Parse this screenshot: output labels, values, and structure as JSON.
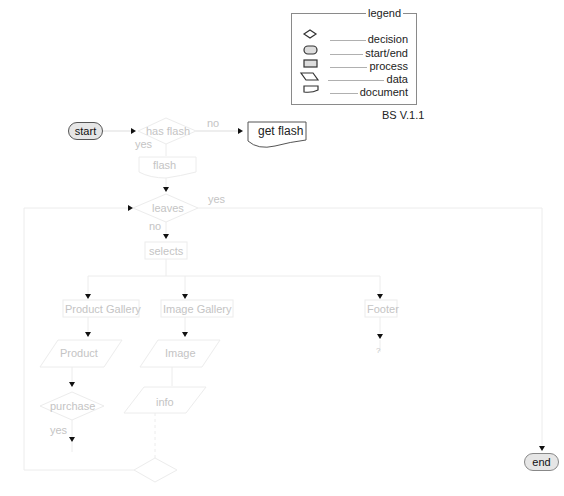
{
  "legend": {
    "title": "legend",
    "items": [
      {
        "icon": "decision-shape-icon",
        "label": "decision"
      },
      {
        "icon": "start-end-shape-icon",
        "label": "start/end"
      },
      {
        "icon": "process-shape-icon",
        "label": "process"
      },
      {
        "icon": "data-shape-icon",
        "label": "data"
      },
      {
        "icon": "document-shape-icon",
        "label": "document"
      }
    ]
  },
  "version": "BS  V.1.1",
  "nodes": {
    "start": "start",
    "has_flash": "has flash",
    "get_flash": "get flash",
    "flash": "flash",
    "leaves": "leaves",
    "selects": "selects",
    "product_gallery": "Product Gallery",
    "image_gallery": "Image Gallery",
    "footer": "Footer",
    "product": "Product",
    "image": "Image",
    "info": "info",
    "purchase": "purchase",
    "end": "end",
    "footer_next": "?"
  },
  "edge_labels": {
    "has_flash_no": "no",
    "has_flash_yes": "yes",
    "leaves_yes": "yes",
    "leaves_no": "no",
    "purchase_yes": "yes"
  },
  "colors": {
    "active_stroke": "#555555",
    "faded_stroke": "#e4e4e4",
    "faded_text": "#c4c4c4",
    "terminal_fill": "#e6e6e6"
  }
}
